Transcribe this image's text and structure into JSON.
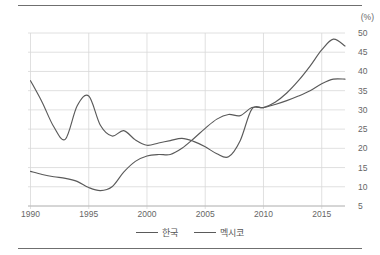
{
  "chart_data": {
    "type": "line",
    "title": "",
    "subtitle": "",
    "xlabel": "",
    "ylabel": "",
    "unit_label": "(%)",
    "grid": true,
    "legend_position": "bottom",
    "xlim": [
      1990,
      2017
    ],
    "ylim": [
      5,
      50
    ],
    "x_tick_labels": [
      "1990",
      "1995",
      "2000",
      "2005",
      "2010",
      "2015"
    ],
    "x_ticks": [
      1990,
      1995,
      2000,
      2005,
      2010,
      2015
    ],
    "y_tick_labels": [
      "50",
      "45",
      "40",
      "35",
      "30",
      "25",
      "20",
      "15",
      "10",
      "5"
    ],
    "y_ticks": [
      50,
      45,
      40,
      35,
      30,
      25,
      20,
      15,
      10,
      5
    ],
    "x": [
      1990,
      1991,
      1992,
      1993,
      1994,
      1995,
      1996,
      1997,
      1998,
      1999,
      2000,
      2001,
      2002,
      2003,
      2004,
      2005,
      2006,
      2007,
      2008,
      2009,
      2010,
      2011,
      2012,
      2013,
      2014,
      2015,
      2016,
      2017
    ],
    "series": [
      {
        "name": "한국",
        "color": "#5a5a5a",
        "values": [
          14.0,
          13.2,
          12.6,
          12.2,
          11.4,
          9.8,
          9.0,
          10.0,
          13.8,
          16.6,
          18.0,
          18.4,
          18.4,
          20.0,
          22.5,
          25.2,
          27.6,
          28.8,
          28.5,
          30.6,
          30.6,
          31.4,
          32.4,
          33.6,
          35.0,
          36.8,
          38.0,
          38.0
        ]
      },
      {
        "name": "멕시코",
        "color": "#5a5a5a",
        "values": [
          37.6,
          32.0,
          25.6,
          22.4,
          31.0,
          33.6,
          26.0,
          23.2,
          24.6,
          22.2,
          20.8,
          21.4,
          22.0,
          22.6,
          21.8,
          20.4,
          18.6,
          17.8,
          22.0,
          30.2,
          30.6,
          32.0,
          34.4,
          37.6,
          41.4,
          45.6,
          48.4,
          46.6
        ]
      }
    ]
  },
  "legend": {
    "entries": [
      {
        "label": "한국"
      },
      {
        "label": "멕시코"
      }
    ]
  }
}
